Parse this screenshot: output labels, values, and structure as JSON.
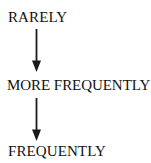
{
  "diagram": {
    "type": "vertical-flow",
    "background_color": "#ffffff",
    "text_color": "#111111",
    "arrow_color": "#1a1a1a",
    "nodes": [
      {
        "id": "rarely",
        "label": "RARELY"
      },
      {
        "id": "more-frequently",
        "label": "MORE FREQUENTLY"
      },
      {
        "id": "frequently",
        "label": "FREQUENTLY"
      }
    ],
    "connectors": [
      {
        "id": "arrow-rarely-to-more-frequently",
        "icon": "down-arrow-icon",
        "from": "rarely",
        "to": "more-frequently"
      },
      {
        "id": "arrow-more-frequently-to-frequently",
        "icon": "down-arrow-icon",
        "from": "more-frequently",
        "to": "frequently"
      }
    ]
  }
}
